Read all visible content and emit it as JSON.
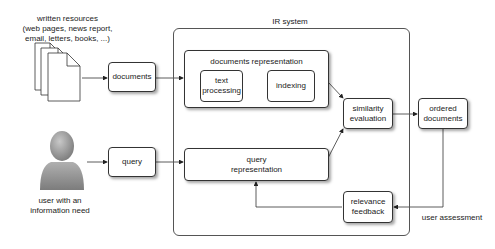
{
  "diagram": {
    "sources": {
      "label_lines": [
        "written resources",
        "(web pages, news report,",
        "email, letters, books, ...)"
      ]
    },
    "user": {
      "label_lines": [
        "user with an",
        "information need"
      ]
    },
    "nodes": {
      "documents": "documents",
      "query": "query",
      "documents_representation": "documents representation",
      "text_processing_lines": [
        "text",
        "processing"
      ],
      "indexing": "indexing",
      "query_representation_lines": [
        "query",
        "representation"
      ],
      "similarity_evaluation_lines": [
        "similarity",
        "evaluation"
      ],
      "ordered_documents_lines": [
        "ordered",
        "documents"
      ],
      "relevance_feedback_lines": [
        "relevance",
        "feedback"
      ]
    },
    "container_label": "IR system",
    "edge_labels": {
      "user_assessment": "user assessment"
    },
    "edges": [
      {
        "from": "written resources",
        "to": "documents"
      },
      {
        "from": "documents",
        "to": "documents representation"
      },
      {
        "from": "user with an information need",
        "to": "query"
      },
      {
        "from": "query",
        "to": "query representation"
      },
      {
        "from": "documents representation",
        "to": "similarity evaluation"
      },
      {
        "from": "query representation",
        "to": "similarity evaluation"
      },
      {
        "from": "similarity evaluation",
        "to": "ordered documents"
      },
      {
        "from": "ordered documents",
        "to": "relevance feedback",
        "label": "user assessment"
      },
      {
        "from": "relevance feedback",
        "to": "query representation"
      }
    ]
  }
}
